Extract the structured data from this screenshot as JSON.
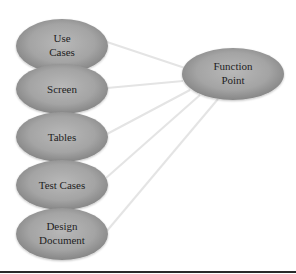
{
  "diagram": {
    "type": "hub-and-spoke",
    "colors": {
      "node_center": "#b6b6b6",
      "node_mid": "#a2a2a2",
      "node_edge": "#868686",
      "connector": "#e6e6e6",
      "text": "#1e1e1e",
      "rule": "#2a2a2a"
    },
    "hub": {
      "id": "function-point",
      "lines": [
        "Function",
        "Point"
      ]
    },
    "sources": [
      {
        "id": "use-cases",
        "lines": [
          "Use",
          "Cases"
        ]
      },
      {
        "id": "screen",
        "lines": [
          "Screen"
        ]
      },
      {
        "id": "tables",
        "lines": [
          "Tables"
        ]
      },
      {
        "id": "test-cases",
        "lines": [
          "Test Cases"
        ]
      },
      {
        "id": "design-document",
        "lines": [
          "Design",
          "Document"
        ]
      }
    ],
    "edges": [
      {
        "from": "use-cases",
        "to": "function-point"
      },
      {
        "from": "screen",
        "to": "function-point"
      },
      {
        "from": "tables",
        "to": "function-point"
      },
      {
        "from": "test-cases",
        "to": "function-point"
      },
      {
        "from": "design-document",
        "to": "function-point"
      }
    ]
  }
}
